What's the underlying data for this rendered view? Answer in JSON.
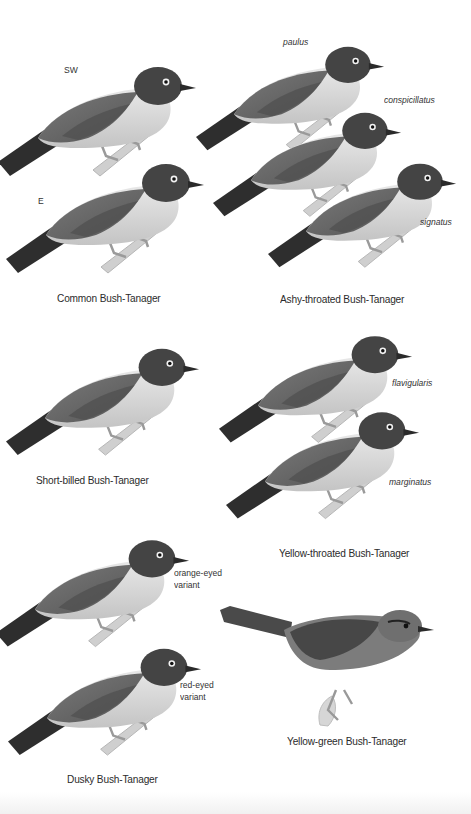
{
  "plate": {
    "color_mode": "grayscale",
    "background": "#ffffff",
    "species": [
      {
        "name": "Common Bush-Tanager",
        "figures": [
          {
            "label": "SW",
            "style": "upright"
          },
          {
            "label": "E",
            "style": "upright"
          }
        ]
      },
      {
        "name": "Ashy-throated Bush-Tanager",
        "figures": [
          {
            "label": "paulus",
            "style": "italic"
          },
          {
            "label": "conspicillatus",
            "style": "italic"
          },
          {
            "label": "signatus",
            "style": "italic"
          }
        ]
      },
      {
        "name": "Short-billed Bush-Tanager",
        "figures": []
      },
      {
        "name": "Yellow-throated Bush-Tanager",
        "figures": [
          {
            "label": "flavigularis",
            "style": "italic"
          },
          {
            "label": "marginatus",
            "style": "italic"
          }
        ]
      },
      {
        "name": "Dusky Bush-Tanager",
        "figures": [
          {
            "label": "orange-eyed\nvariant",
            "style": "upright"
          },
          {
            "label": "red-eyed\nvariant",
            "style": "upright"
          }
        ]
      },
      {
        "name": "Yellow-green Bush-Tanager",
        "figures": []
      }
    ]
  },
  "tones": {
    "cap_dark": "#3a3a3a",
    "back": "#6e6e6e",
    "wing": "#555555",
    "tail": "#2e2e2e",
    "belly": "#d8d8d8",
    "throat": "#e6e6e6",
    "leg": "#a9a9a9",
    "branch": "#c9c9c9"
  }
}
